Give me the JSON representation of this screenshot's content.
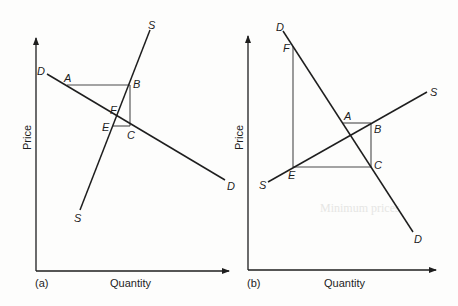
{
  "figure": {
    "background_color": "#fdfdfc",
    "line_color": "#1e1e1e",
    "guide_color": "#4a4a4a",
    "ghost_text": "Minimum prices",
    "panels": [
      {
        "id": "a",
        "panel_label": "(a)",
        "x_axis_label": "Quantity",
        "y_axis_label": "Price",
        "curves": {
          "demand": {
            "label_start": "D",
            "label_end": "D"
          },
          "supply": {
            "label_start": "S",
            "label_end": "S"
          }
        },
        "points": {
          "A": "A",
          "B": "B",
          "C": "C",
          "E": "E",
          "F": "F"
        }
      },
      {
        "id": "b",
        "panel_label": "(b)",
        "x_axis_label": "Quantity",
        "y_axis_label": "Price",
        "curves": {
          "demand": {
            "label_start": "D",
            "label_end": "D"
          },
          "supply": {
            "label_start": "S",
            "label_end": "S"
          }
        },
        "points": {
          "A": "A",
          "B": "B",
          "C": "C",
          "E": "E",
          "F": "F"
        }
      }
    ]
  }
}
